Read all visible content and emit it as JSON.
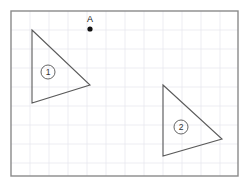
{
  "figure": {
    "background_color": "#ffffff",
    "border": {
      "color": "#8a8a8a",
      "x": 11,
      "y": 11,
      "width": 227,
      "height": 165,
      "stroke_width": 1.4
    },
    "grid": {
      "visible": true,
      "color": "#e9e9ef",
      "cell_size": 19,
      "stroke_width": 0.8,
      "origin_x": 11,
      "origin_y": 11
    },
    "stroke_color": "#5a5a5a",
    "stroke_width": 1.1,
    "points": [
      {
        "name": "A",
        "label": "A",
        "label_x": 90,
        "label_y": 22,
        "dot_x": 90,
        "dot_y": 29,
        "dot_radius": 2.6,
        "dot_color": "#111111"
      }
    ],
    "shapes": [
      {
        "id": "triangle-1",
        "number_label": "①",
        "number_x": 48,
        "number_y": 72,
        "number_radius": 7,
        "vertices": [
          {
            "x": 32,
            "y": 30
          },
          {
            "x": 90,
            "y": 85
          },
          {
            "x": 32,
            "y": 103
          }
        ]
      },
      {
        "id": "triangle-2",
        "number_label": "②",
        "number_x": 181,
        "number_y": 127,
        "number_radius": 7,
        "vertices": [
          {
            "x": 163,
            "y": 85
          },
          {
            "x": 222,
            "y": 139
          },
          {
            "x": 163,
            "y": 156
          }
        ]
      }
    ]
  }
}
